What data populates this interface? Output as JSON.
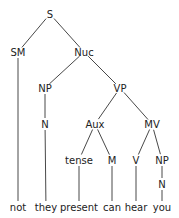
{
  "diagram": {
    "type": "syntax-tree",
    "colors": {
      "line": "#333333",
      "text": "#222222",
      "background": "#ffffff"
    },
    "nodes": [
      {
        "id": "S",
        "label": "S",
        "x": 50,
        "y": 14
      },
      {
        "id": "SM",
        "label": "SM",
        "x": 18,
        "y": 52
      },
      {
        "id": "Nuc",
        "label": "Nuc",
        "x": 84,
        "y": 52
      },
      {
        "id": "NP1",
        "label": "NP",
        "x": 45,
        "y": 88
      },
      {
        "id": "VP",
        "label": "VP",
        "x": 120,
        "y": 88
      },
      {
        "id": "N1",
        "label": "N",
        "x": 45,
        "y": 124
      },
      {
        "id": "Aux",
        "label": "Aux",
        "x": 95,
        "y": 124
      },
      {
        "id": "MV",
        "label": "MV",
        "x": 152,
        "y": 124
      },
      {
        "id": "tense",
        "label": "tense",
        "x": 79,
        "y": 160
      },
      {
        "id": "M",
        "label": "M",
        "x": 112,
        "y": 160
      },
      {
        "id": "V",
        "label": "V",
        "x": 136,
        "y": 160
      },
      {
        "id": "NP2",
        "label": "NP",
        "x": 162,
        "y": 160
      },
      {
        "id": "N2",
        "label": "N",
        "x": 162,
        "y": 184
      },
      {
        "id": "not",
        "label": "not",
        "x": 18,
        "y": 207
      },
      {
        "id": "they",
        "label": "they",
        "x": 46,
        "y": 207
      },
      {
        "id": "present",
        "label": "present",
        "x": 79,
        "y": 207
      },
      {
        "id": "can",
        "label": "can",
        "x": 112,
        "y": 207
      },
      {
        "id": "hear",
        "label": "hear",
        "x": 136,
        "y": 207
      },
      {
        "id": "you",
        "label": "you",
        "x": 162,
        "y": 207
      }
    ],
    "edges": [
      [
        "S",
        "SM"
      ],
      [
        "S",
        "Nuc"
      ],
      [
        "SM",
        "not"
      ],
      [
        "Nuc",
        "NP1"
      ],
      [
        "Nuc",
        "VP"
      ],
      [
        "NP1",
        "N1"
      ],
      [
        "N1",
        "they"
      ],
      [
        "VP",
        "Aux"
      ],
      [
        "VP",
        "MV"
      ],
      [
        "Aux",
        "tense"
      ],
      [
        "Aux",
        "M"
      ],
      [
        "tense",
        "present"
      ],
      [
        "M",
        "can"
      ],
      [
        "MV",
        "V"
      ],
      [
        "MV",
        "NP2"
      ],
      [
        "V",
        "hear"
      ],
      [
        "NP2",
        "N2"
      ],
      [
        "N2",
        "you"
      ]
    ],
    "leaves": [
      "not",
      "they",
      "present",
      "can",
      "hear",
      "you"
    ]
  }
}
